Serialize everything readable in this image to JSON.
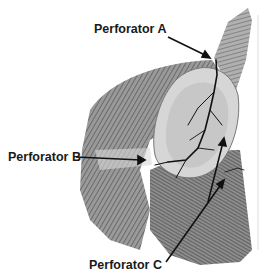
{
  "figure": {
    "labels": {
      "a": "Perforator A",
      "b": "Perforator B",
      "c": "Perforator C"
    },
    "colors": {
      "ink": "#1a1a1a",
      "muscle_dark": "#4a4a4a",
      "muscle_mid": "#8a8a8a",
      "muscle_light": "#c8c8c8",
      "background": "#ffffff"
    }
  }
}
